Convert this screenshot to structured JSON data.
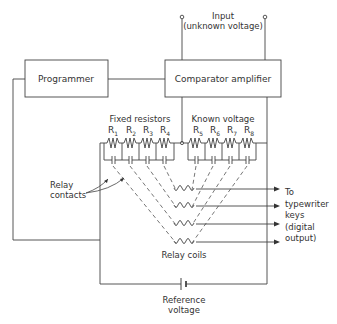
{
  "diagram": {
    "type": "circuit-schematic",
    "input_label_line1": "Input",
    "input_label_line2": "(unknown voltage)",
    "programmer_label": "Programmer",
    "comparator_label": "Comparator amplifier",
    "fixed_resistors_label": "Fixed resistors",
    "known_voltage_label": "Known voltage",
    "resistors": [
      {
        "name": "R",
        "sub": "1"
      },
      {
        "name": "R",
        "sub": "2"
      },
      {
        "name": "R",
        "sub": "3"
      },
      {
        "name": "R",
        "sub": "4"
      },
      {
        "name": "R",
        "sub": "5"
      },
      {
        "name": "R",
        "sub": "6"
      },
      {
        "name": "R",
        "sub": "7"
      },
      {
        "name": "R",
        "sub": "8"
      }
    ],
    "relay_contacts_line1": "Relay",
    "relay_contacts_line2": "contacts",
    "relay_coils_label": "Relay coils",
    "output_line1": "To",
    "output_line2": "typewriter",
    "output_line3": "keys",
    "output_line4": "(digital",
    "output_line5": "output)",
    "reference_line1": "Reference",
    "reference_line2": "voltage",
    "line_color": "#444444"
  }
}
